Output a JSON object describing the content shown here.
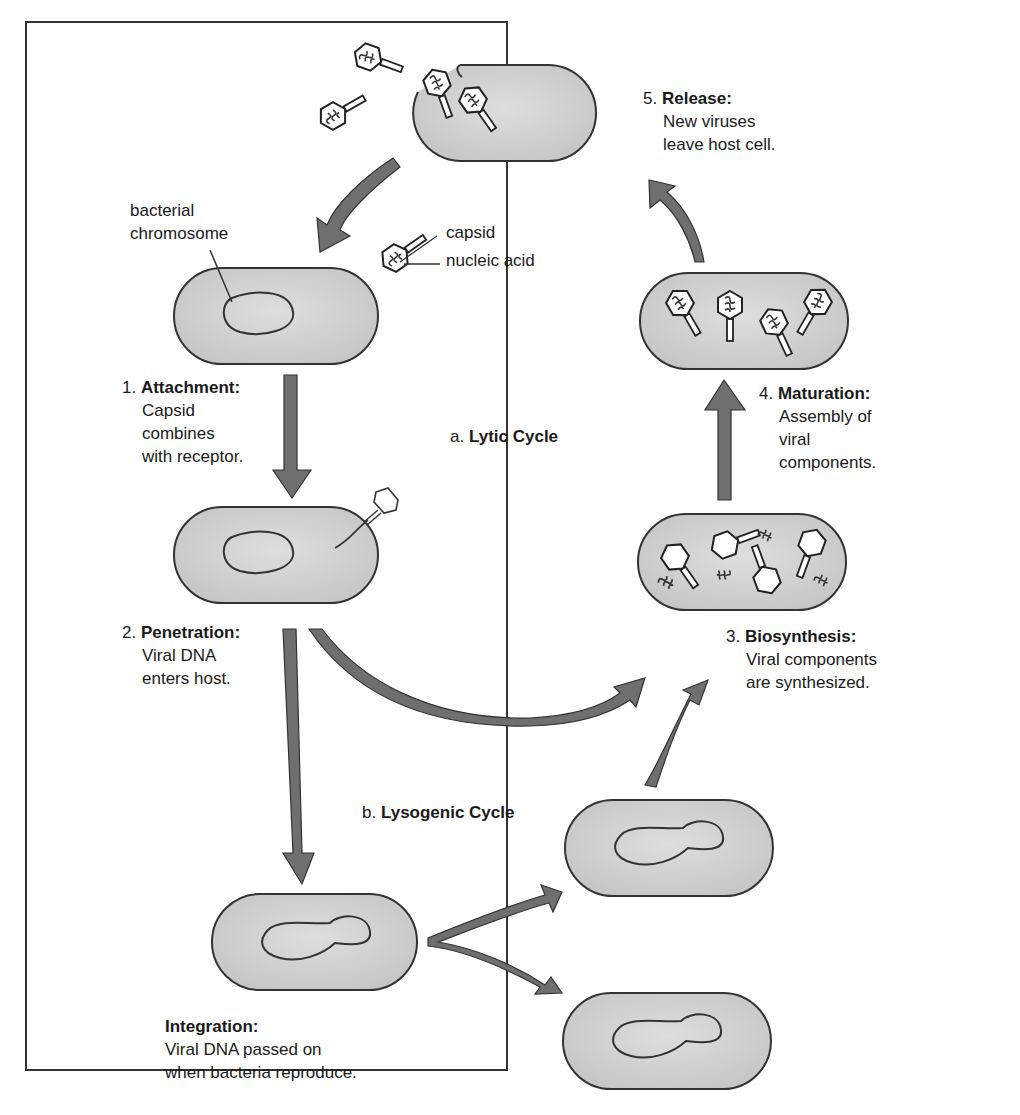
{
  "diagram": {
    "title_lytic": {
      "prefix": "a.",
      "name": "Lytic Cycle"
    },
    "title_lysogenic": {
      "prefix": "b.",
      "name": "Lysogenic Cycle"
    },
    "callouts": {
      "bacterial_chromosome_line1": "bacterial",
      "bacterial_chromosome_line2": "chromosome",
      "capsid": "capsid",
      "nucleic_acid": "nucleic acid"
    },
    "steps": [
      {
        "num": "1.",
        "title": "Attachment:",
        "lines": [
          "Capsid",
          "combines",
          "with receptor."
        ]
      },
      {
        "num": "2.",
        "title": "Penetration:",
        "lines": [
          "Viral DNA",
          "enters host."
        ]
      },
      {
        "num": "3.",
        "title": "Biosynthesis:",
        "lines": [
          "Viral components",
          "are synthesized."
        ]
      },
      {
        "num": "4.",
        "title": "Maturation:",
        "lines": [
          "Assembly of",
          "viral",
          "components."
        ]
      },
      {
        "num": "5.",
        "title": "Release:",
        "lines": [
          "New viruses",
          "leave host cell."
        ]
      }
    ],
    "integration": {
      "title": "Integration:",
      "lines": [
        "Viral DNA passed on",
        "when bacteria reproduce."
      ]
    },
    "colors": {
      "cell_fill": "#d2d2d2",
      "cell_stroke": "#333333",
      "arrow_fill": "#6f6f6f",
      "frame": "#333333",
      "text": "#1a1a1a"
    }
  }
}
